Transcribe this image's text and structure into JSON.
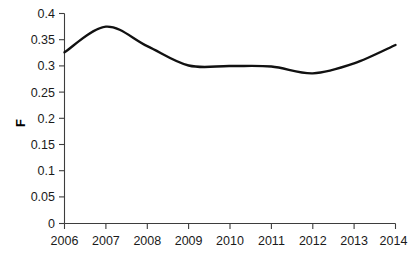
{
  "chart_data": {
    "type": "line",
    "title": "",
    "subtitle": "",
    "xlabel": "",
    "ylabel": "F",
    "x": [
      2006,
      2007,
      2008,
      2009,
      2010,
      2011,
      2012,
      2013,
      2014
    ],
    "categories": [
      "2006",
      "2007",
      "2008",
      "2009",
      "2010",
      "2011",
      "2012",
      "2013",
      "2014"
    ],
    "series": [
      {
        "name": "F",
        "values": [
          0.326,
          0.375,
          0.338,
          0.301,
          0.3,
          0.299,
          0.286,
          0.305,
          0.34
        ]
      }
    ],
    "xlim": [
      2006,
      2014
    ],
    "ylim": [
      0,
      0.4
    ],
    "ytick_values": [
      0,
      0.05,
      0.1,
      0.15,
      0.2,
      0.25,
      0.3,
      0.35,
      0.4
    ],
    "ytick_labels": [
      "0",
      "0.05",
      "0.1",
      "0.15",
      "0.2",
      "0.25",
      "0.3",
      "0.35",
      "0.4"
    ],
    "xtick_labels": [
      "2006",
      "2007",
      "2008",
      "2009",
      "2010",
      "2011",
      "2012",
      "2013",
      "2014"
    ],
    "grid": false,
    "legend": false,
    "legend_position": "none",
    "line_color": "#111111",
    "axis_color": "#3d3d3d",
    "background_color": "#ffffff",
    "markers": false,
    "smoothing": "spline",
    "annotations": []
  },
  "axes": {
    "y_title": "F",
    "y_labels": [
      "0.4",
      "0.35",
      "0.3",
      "0.25",
      "0.2",
      "0.15",
      "0.1",
      "0.05",
      "0"
    ],
    "x_labels": [
      "2006",
      "2007",
      "2008",
      "2009",
      "2010",
      "2011",
      "2012",
      "2013",
      "2014"
    ]
  }
}
